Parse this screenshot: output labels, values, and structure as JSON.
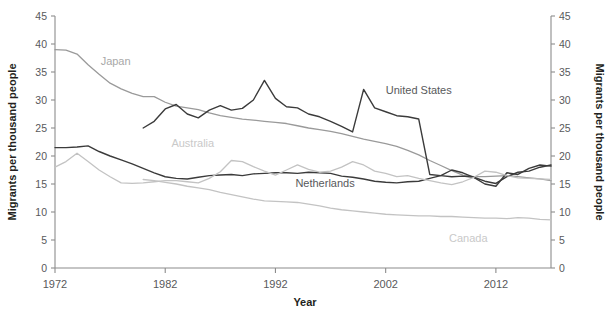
{
  "chart_data": {
    "type": "line",
    "title": "",
    "xlabel": "Year",
    "ylabel": "Migrants per thousand people",
    "ylabel_right": "Migrants per thousand people",
    "xlim": [
      1972,
      2017
    ],
    "ylim": [
      0,
      45
    ],
    "grid": false,
    "legend": "inline-labels",
    "x_ticks": [
      "1972",
      "1982",
      "1992",
      "2002",
      "2012"
    ],
    "x_tick_values": [
      1972,
      1982,
      1992,
      2002,
      2012
    ],
    "y_ticks": [
      "0",
      "5",
      "10",
      "15",
      "20",
      "25",
      "30",
      "35",
      "40",
      "45"
    ],
    "y_tick_values": [
      0,
      5,
      10,
      15,
      20,
      25,
      30,
      35,
      40,
      45
    ],
    "series": [
      {
        "name": "Japan",
        "color": "#9a9a9a",
        "width": 1.3,
        "label_x": 1977.5,
        "label_y": 36.2,
        "label_color": "#a8a8a8",
        "x": [
          1972,
          1973,
          1974,
          1975,
          1976,
          1977,
          1978,
          1979,
          1980,
          1981,
          1982,
          1983,
          1984,
          1985,
          1986,
          1987,
          1988,
          1989,
          1990,
          1991,
          1992,
          1993,
          1994,
          1995,
          1996,
          1997,
          1998,
          1999,
          2000,
          2001,
          2002,
          2003,
          2004,
          2005,
          2006,
          2007,
          2008,
          2009,
          2010,
          2011,
          2012,
          2013,
          2014,
          2015,
          2016,
          2017
        ],
        "y": [
          39.0,
          38.9,
          38.2,
          36.3,
          34.6,
          33.0,
          32.0,
          31.2,
          30.6,
          30.6,
          29.6,
          28.9,
          28.6,
          28.3,
          27.7,
          27.2,
          26.9,
          26.6,
          26.4,
          26.2,
          26.0,
          25.8,
          25.4,
          25.0,
          24.7,
          24.4,
          24.0,
          23.5,
          23.0,
          22.6,
          22.2,
          21.7,
          21.0,
          20.2,
          19.2,
          18.3,
          17.4,
          16.6,
          16.3,
          16.3,
          16.4,
          16.5,
          16.3,
          16.1,
          15.9,
          15.6
        ]
      },
      {
        "name": "United States",
        "color": "#3b3b3b",
        "width": 1.4,
        "label_x": 2005.0,
        "label_y": 31.0,
        "label_color": "#58595b",
        "x": [
          1980,
          1981,
          1982,
          1983,
          1984,
          1985,
          1986,
          1987,
          1988,
          1989,
          1990,
          1991,
          1992,
          1993,
          1994,
          1995,
          1996,
          1997,
          1998,
          1999,
          2000,
          2001,
          2002,
          2003,
          2004,
          2005,
          2006,
          2007,
          2008,
          2009,
          2010,
          2011,
          2012,
          2013,
          2014,
          2015,
          2016,
          2017
        ],
        "y": [
          25.0,
          26.2,
          28.4,
          29.2,
          27.5,
          26.8,
          28.2,
          29.0,
          28.2,
          28.5,
          30.0,
          33.5,
          30.3,
          28.8,
          28.6,
          27.5,
          27.0,
          26.2,
          25.3,
          24.3,
          31.9,
          28.6,
          27.9,
          27.2,
          27.0,
          26.6,
          16.7,
          16.5,
          16.3,
          16.4,
          16.2,
          15.0,
          14.6,
          17.0,
          16.7,
          17.8,
          18.4,
          18.2
        ]
      },
      {
        "name": "Netherlands",
        "color": "#3b3b3b",
        "width": 1.4,
        "label_x": 1996.5,
        "label_y": 14.4,
        "label_color": "#58595b",
        "x": [
          1972,
          1973,
          1974,
          1975,
          1976,
          1977,
          1978,
          1979,
          1980,
          1981,
          1982,
          1983,
          1984,
          1985,
          1986,
          1987,
          1988,
          1989,
          1990,
          1991,
          1992,
          1993,
          1994,
          1995,
          1996,
          1997,
          1998,
          1999,
          2000,
          2001,
          2002,
          2003,
          2004,
          2005,
          2006,
          2007,
          2008,
          2009,
          2010,
          2011,
          2012,
          2013,
          2014,
          2015,
          2016,
          2017
        ],
        "y": [
          21.5,
          21.5,
          21.6,
          21.8,
          20.8,
          20.0,
          19.3,
          18.6,
          17.8,
          17.0,
          16.3,
          16.0,
          15.9,
          16.2,
          16.5,
          16.6,
          16.7,
          16.5,
          16.8,
          16.9,
          17.0,
          17.0,
          16.9,
          17.1,
          17.0,
          16.9,
          16.4,
          16.2,
          15.9,
          15.5,
          15.3,
          15.2,
          15.4,
          15.5,
          16.0,
          16.5,
          17.5,
          17.0,
          16.2,
          15.5,
          15.1,
          16.3,
          17.1,
          17.3,
          18.0,
          18.4
        ]
      },
      {
        "name": "Australia",
        "color": "#c3c3c3",
        "width": 1.3,
        "label_x": 1984.5,
        "label_y": 21.6,
        "label_color": "#c9c9c9",
        "x": [
          1972,
          1973,
          1974,
          1975,
          1976,
          1977,
          1978,
          1979,
          1980,
          1981,
          1982,
          1983,
          1984,
          1985,
          1986,
          1987,
          1988,
          1989,
          1990,
          1991,
          1992,
          1993,
          1994,
          1995,
          1996,
          1997,
          1998,
          1999,
          2000,
          2001,
          2002,
          2003,
          2004,
          2005,
          2006,
          2007,
          2008,
          2009,
          2010,
          2011,
          2012,
          2013,
          2014,
          2015,
          2016,
          2017
        ],
        "y": [
          18.0,
          19.0,
          20.5,
          19.0,
          17.5,
          16.3,
          15.2,
          15.1,
          15.2,
          15.4,
          15.6,
          15.6,
          15.4,
          15.2,
          16.0,
          17.2,
          19.2,
          19.0,
          18.1,
          17.3,
          16.6,
          17.5,
          18.4,
          17.6,
          17.1,
          17.3,
          18.0,
          19.0,
          18.4,
          17.3,
          16.9,
          16.3,
          16.5,
          16.0,
          15.6,
          15.2,
          14.9,
          15.4,
          16.2,
          17.3,
          17.1,
          16.5,
          16.1,
          16.0,
          15.9,
          15.8
        ]
      },
      {
        "name": "Canada",
        "color": "#c3c3c3",
        "width": 1.3,
        "label_x": 2009.5,
        "label_y": 4.6,
        "label_color": "#c9c9c9",
        "x": [
          1980,
          1981,
          1982,
          1983,
          1984,
          1985,
          1986,
          1987,
          1988,
          1989,
          1990,
          1991,
          1992,
          1993,
          1994,
          1995,
          1996,
          1997,
          1998,
          1999,
          2000,
          2001,
          2002,
          2003,
          2004,
          2005,
          2006,
          2007,
          2008,
          2009,
          2010,
          2011,
          2012,
          2013,
          2014,
          2015,
          2016,
          2017
        ],
        "y": [
          15.8,
          15.6,
          15.3,
          15.0,
          14.6,
          14.3,
          14.0,
          13.5,
          13.1,
          12.7,
          12.3,
          12.0,
          11.9,
          11.8,
          11.7,
          11.4,
          11.1,
          10.7,
          10.4,
          10.2,
          10.0,
          9.8,
          9.6,
          9.5,
          9.4,
          9.3,
          9.3,
          9.2,
          9.2,
          9.1,
          9.0,
          8.9,
          8.9,
          8.8,
          9.0,
          8.9,
          8.7,
          8.6
        ]
      }
    ]
  },
  "axes": {
    "y_title": "Migrants per thousand people",
    "y_title_right": "Migrants per thousand people",
    "x_title": "Year"
  }
}
